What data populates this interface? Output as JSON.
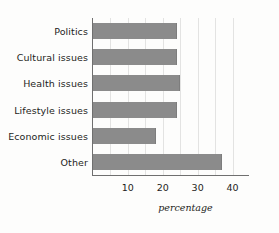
{
  "chart_data": {
    "type": "bar",
    "orientation": "horizontal",
    "title": "",
    "subtitle": "",
    "xlabel": "percentage",
    "ylabel": "",
    "categories": [
      "Politics",
      "Cultural issues",
      "Health issues",
      "Lifestyle issues",
      "Economic issues",
      "Other"
    ],
    "values": [
      24,
      24,
      25,
      24,
      18,
      37
    ],
    "xlim": [
      0,
      43
    ],
    "ylim": [
      0,
      6
    ],
    "xticks": [
      10,
      20,
      30,
      40
    ],
    "xtick_labels": [
      "10",
      "20",
      "30",
      "40"
    ],
    "gridlines": [
      5,
      10,
      15,
      20,
      25,
      30,
      35,
      40
    ],
    "grid": true,
    "grid_axis": "x",
    "legend": false,
    "legend_position": "none",
    "bar_color": "#8b8b8b",
    "axis_color": "#6f6f6f",
    "grid_color": "#e3e3e2",
    "text_color": "#1d1d1b",
    "background_color": "#fdfdfc"
  }
}
